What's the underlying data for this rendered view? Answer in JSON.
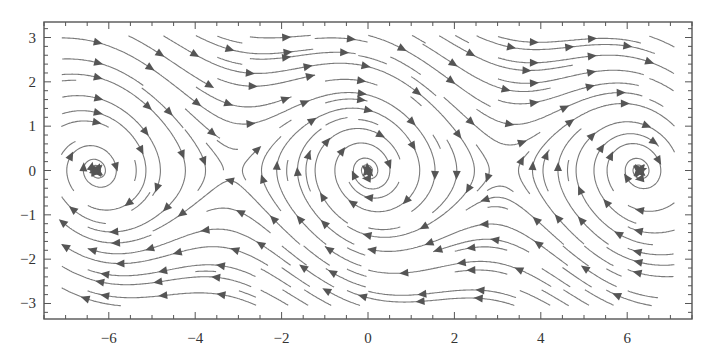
{
  "chart_data": {
    "type": "streamplot",
    "title": "",
    "xlabel": "",
    "ylabel": "",
    "system": {
      "dx": "y",
      "dy": "-sin(x) - c*y",
      "damping_c": 0.25
    },
    "xlim": [
      -7.5,
      7.5
    ],
    "ylim": [
      -3.35,
      3.35
    ],
    "x_ticks": [
      -6,
      -4,
      -2,
      0,
      2,
      4,
      6
    ],
    "x_tick_labels": [
      "−6",
      "−4",
      "−2",
      "0",
      "2",
      "4",
      "6"
    ],
    "y_ticks": [
      -3,
      -2,
      -1,
      0,
      1,
      2,
      3
    ],
    "y_tick_labels": [
      "−3",
      "−2",
      "−1",
      "0",
      "1",
      "2",
      "3"
    ],
    "x_minor_step": 0.5,
    "y_minor_step": 0.2,
    "grid": false,
    "legend": null,
    "fixed_points": [
      {
        "x": -6.283,
        "y": 0,
        "kind": "stable spiral"
      },
      {
        "x": -3.1416,
        "y": 0,
        "kind": "saddle"
      },
      {
        "x": 0,
        "y": 0,
        "kind": "stable spiral"
      },
      {
        "x": 3.1416,
        "y": 0,
        "kind": "saddle"
      },
      {
        "x": 6.283,
        "y": 0,
        "kind": "stable spiral"
      }
    ],
    "colors": {
      "stream": "#7a7a7a",
      "arrow": "#555555",
      "frame": "#555555",
      "text": "#333333"
    }
  },
  "plot_area_px": {
    "left": 44,
    "top": 22,
    "right": 692,
    "bottom": 319
  }
}
